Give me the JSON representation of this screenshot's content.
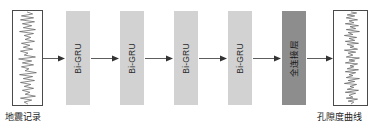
{
  "diagram": {
    "background_color": "#ffffff",
    "input": {
      "name": "seismic-record",
      "caption": "地震记录",
      "box_border_color": "#4a4a4a",
      "trace_color": "#555555",
      "trace_kind": "seismic-waveform"
    },
    "output": {
      "name": "porosity-curve",
      "caption": "孔隙度曲线",
      "box_border_color": "#4a4a4a",
      "trace_color": "#555555",
      "trace_kind": "porosity-log"
    },
    "layers": [
      {
        "id": "bigru-1",
        "label": "Bi-GRU",
        "type": "recurrent",
        "color": "#d2d2d2",
        "x": 66
      },
      {
        "id": "bigru-2",
        "label": "Bi-GRU",
        "type": "recurrent",
        "color": "#d2d2d2",
        "x": 120
      },
      {
        "id": "bigru-3",
        "label": "Bi-GRU",
        "type": "recurrent",
        "color": "#d2d2d2",
        "x": 174
      },
      {
        "id": "bigru-4",
        "label": "Bi-GRU",
        "type": "recurrent",
        "color": "#d2d2d2",
        "x": 228
      },
      {
        "id": "dense-1",
        "label": "全连接层",
        "type": "fully-connected",
        "color": "#8d8d8d",
        "x": 282
      }
    ],
    "arrows": [
      {
        "id": "arrow-input-to-bigru1",
        "from": "seismic-record",
        "to": "bigru-1",
        "x": 43,
        "width": 22
      },
      {
        "id": "arrow-bigru1-to-bigru2",
        "from": "bigru-1",
        "to": "bigru-2",
        "x": 91,
        "width": 28
      },
      {
        "id": "arrow-bigru2-to-bigru3",
        "from": "bigru-2",
        "to": "bigru-3",
        "x": 145,
        "width": 28
      },
      {
        "id": "arrow-bigru3-to-bigru4",
        "from": "bigru-3",
        "to": "bigru-4",
        "x": 199,
        "width": 28
      },
      {
        "id": "arrow-bigru4-to-dense",
        "from": "bigru-4",
        "to": "dense-1",
        "x": 253,
        "width": 28
      },
      {
        "id": "arrow-dense-to-output",
        "from": "dense-1",
        "to": "porosity-curve",
        "x": 307,
        "width": 26
      }
    ],
    "arrow_color": "#333333"
  }
}
